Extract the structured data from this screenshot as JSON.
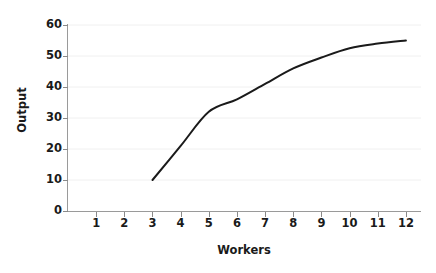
{
  "chart_data": {
    "type": "line",
    "title": "",
    "subtitle": "",
    "xlabel": "Workers",
    "ylabel": "Output",
    "xlim": [
      0,
      12.5
    ],
    "ylim": [
      0,
      60
    ],
    "xticks": [
      1,
      2,
      3,
      4,
      5,
      6,
      7,
      8,
      9,
      10,
      11,
      12
    ],
    "xtick_labels": [
      "1",
      "2",
      "3",
      "4",
      "5",
      "6",
      "7",
      "8",
      "9",
      "10",
      "11",
      "12"
    ],
    "yticks": [
      0,
      10,
      20,
      30,
      40,
      50,
      60
    ],
    "ytick_labels": [
      "0",
      "10",
      "20",
      "30",
      "40",
      "50",
      "60"
    ],
    "grid": true,
    "grid_axis": "y",
    "grid_color": "#f0f0f0",
    "legend": false,
    "legend_position": "none",
    "series": [
      {
        "name": "Total Product",
        "color": "#1a1a1a",
        "line_width": 2.0,
        "x": [
          3,
          4,
          5,
          6,
          7,
          8,
          9,
          10,
          11,
          12
        ],
        "values": [
          10,
          21,
          32,
          36,
          41,
          46,
          49.5,
          52.5,
          54,
          55
        ]
      }
    ]
  },
  "axes": {
    "axis_color": "#9a9a9a",
    "tick_color": "#8a8a8a",
    "label_color": "#1a1a1a"
  },
  "canvas": {
    "background": "#ffffff",
    "width": 436,
    "height": 273
  }
}
